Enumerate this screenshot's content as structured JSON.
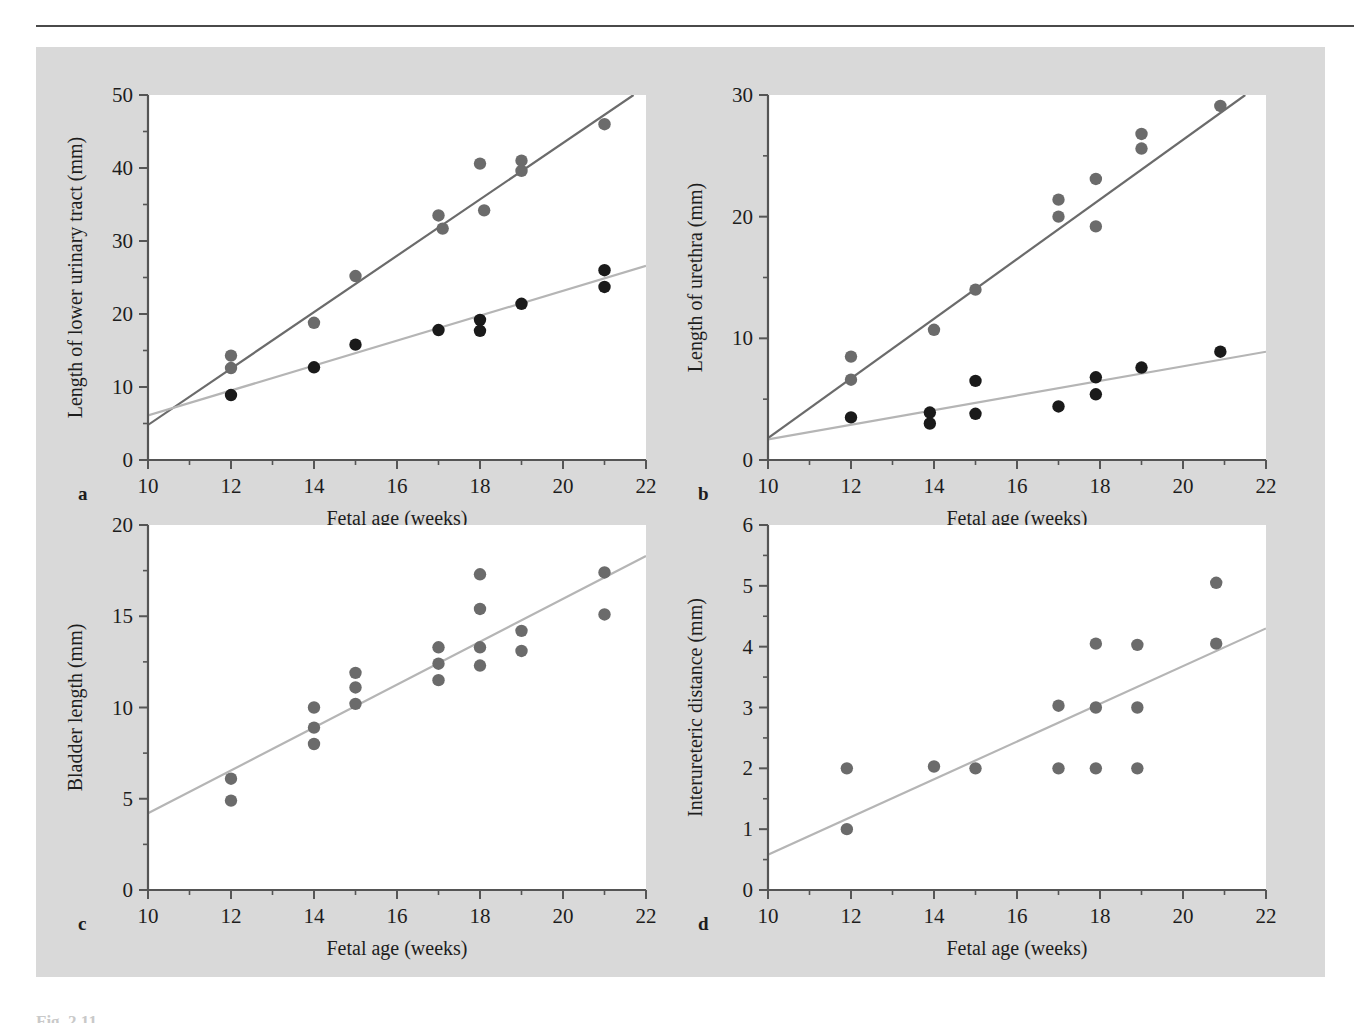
{
  "figure": {
    "background_color": "#d9d9d9",
    "plot_color": "#ffffff",
    "axis_color": "#555555",
    "dark_series_color": "#6b6b6b",
    "black_series_color": "#1a1a1a",
    "light_line_color": "#b5b5b5",
    "caption_partial": "Fig. 2.11",
    "shared_xlabel": "Fetal age (weeks)"
  },
  "panels": [
    {
      "letter": "a",
      "xlabel": "Fetal age (weeks)",
      "ylabel": "Length of lower urinary tract (mm)"
    },
    {
      "letter": "b",
      "xlabel": "Fetal age (weeks)",
      "ylabel": "Length of urethra (mm)"
    },
    {
      "letter": "c",
      "xlabel": "Fetal age (weeks)",
      "ylabel": "Bladder length (mm)"
    },
    {
      "letter": "d",
      "xlabel": "Fetal age (weeks)",
      "ylabel": "Interureteric distance (mm)"
    }
  ],
  "chart_data": [
    {
      "type": "scatter",
      "panel": "a",
      "title": "",
      "xlabel": "Fetal age (weeks)",
      "ylabel": "Length of lower urinary tract (mm)",
      "xlim": [
        10,
        22
      ],
      "ylim": [
        0,
        50
      ],
      "xticks": [
        10,
        12,
        14,
        16,
        18,
        20,
        22
      ],
      "xtick_labels": [
        "10",
        "12",
        "14",
        "16",
        "18",
        "20",
        "22"
      ],
      "xminorticks": [
        11,
        13,
        15,
        17,
        19,
        21
      ],
      "yticks": [
        0,
        10,
        20,
        30,
        40,
        50
      ],
      "ytick_labels": [
        "0",
        "10",
        "20",
        "30",
        "40",
        "50"
      ],
      "yminorticks": [
        5,
        15,
        25,
        35,
        45
      ],
      "grid": false,
      "legend": "none",
      "series": [
        {
          "name": "total lower urinary tract",
          "color": "#6b6b6b",
          "marker": "circle",
          "points": [
            [
              12.0,
              14.3
            ],
            [
              12.0,
              12.6
            ],
            [
              14.0,
              18.8
            ],
            [
              15.0,
              25.2
            ],
            [
              17.0,
              33.5
            ],
            [
              17.1,
              31.7
            ],
            [
              18.0,
              40.6
            ],
            [
              18.1,
              34.2
            ],
            [
              19.0,
              41.0
            ],
            [
              19.0,
              39.6
            ],
            [
              21.0,
              46.0
            ]
          ],
          "fit_line": {
            "x": [
              10,
              21.7
            ],
            "y": [
              4.8,
              50.0
            ]
          }
        },
        {
          "name": "urethra subset",
          "color": "#1a1a1a",
          "marker": "circle",
          "points": [
            [
              12.0,
              8.9
            ],
            [
              14.0,
              12.7
            ],
            [
              15.0,
              15.8
            ],
            [
              17.0,
              17.8
            ],
            [
              18.0,
              19.2
            ],
            [
              18.0,
              17.7
            ],
            [
              19.0,
              21.4
            ],
            [
              21.0,
              26.0
            ],
            [
              21.0,
              23.7
            ]
          ],
          "fit_line": {
            "x": [
              10,
              22
            ],
            "y": [
              6.1,
              26.6
            ]
          }
        }
      ]
    },
    {
      "type": "scatter",
      "panel": "b",
      "title": "",
      "xlabel": "Fetal age (weeks)",
      "ylabel": "Length of urethra (mm)",
      "xlim": [
        10,
        22
      ],
      "ylim": [
        0,
        30
      ],
      "xticks": [
        10,
        12,
        14,
        16,
        18,
        20,
        22
      ],
      "xtick_labels": [
        "10",
        "12",
        "14",
        "16",
        "18",
        "20",
        "22"
      ],
      "xminorticks": [
        11,
        13,
        15,
        17,
        19,
        21
      ],
      "yticks": [
        0,
        10,
        20,
        30
      ],
      "ytick_labels": [
        "0",
        "10",
        "20",
        "30"
      ],
      "yminorticks": [
        5,
        15,
        25
      ],
      "grid": false,
      "legend": "none",
      "series": [
        {
          "name": "grey series",
          "color": "#6b6b6b",
          "marker": "circle",
          "points": [
            [
              12.0,
              8.5
            ],
            [
              12.0,
              6.6
            ],
            [
              14.0,
              10.7
            ],
            [
              15.0,
              14.0
            ],
            [
              17.0,
              21.4
            ],
            [
              17.0,
              20.0
            ],
            [
              17.9,
              23.1
            ],
            [
              17.9,
              19.2
            ],
            [
              19.0,
              26.8
            ],
            [
              19.0,
              25.6
            ],
            [
              20.9,
              29.1
            ]
          ],
          "fit_line": {
            "x": [
              10,
              21.5
            ],
            "y": [
              1.8,
              30.0
            ]
          }
        },
        {
          "name": "black series",
          "color": "#1a1a1a",
          "marker": "circle",
          "points": [
            [
              12.0,
              3.5
            ],
            [
              13.9,
              3.9
            ],
            [
              13.9,
              3.0
            ],
            [
              15.0,
              6.5
            ],
            [
              15.0,
              3.8
            ],
            [
              17.0,
              4.4
            ],
            [
              17.9,
              6.8
            ],
            [
              17.9,
              5.4
            ],
            [
              19.0,
              7.6
            ],
            [
              20.9,
              8.9
            ]
          ],
          "fit_line": {
            "x": [
              10,
              22
            ],
            "y": [
              1.7,
              8.9
            ]
          }
        }
      ]
    },
    {
      "type": "scatter",
      "panel": "c",
      "title": "",
      "xlabel": "Fetal age (weeks)",
      "ylabel": "Bladder length (mm)",
      "xlim": [
        10,
        22
      ],
      "ylim": [
        0,
        20
      ],
      "xticks": [
        10,
        12,
        14,
        16,
        18,
        20,
        22
      ],
      "xtick_labels": [
        "10",
        "12",
        "14",
        "16",
        "18",
        "20",
        "22"
      ],
      "xminorticks": [
        11,
        13,
        15,
        17,
        19,
        21
      ],
      "yticks": [
        0,
        5,
        10,
        15,
        20
      ],
      "ytick_labels": [
        "0",
        "5",
        "10",
        "15",
        "20"
      ],
      "yminorticks": [
        2.5,
        7.5,
        12.5,
        17.5
      ],
      "grid": false,
      "legend": "none",
      "series": [
        {
          "name": "bladder length",
          "color": "#6b6b6b",
          "marker": "circle",
          "points": [
            [
              12.0,
              6.1
            ],
            [
              12.0,
              4.9
            ],
            [
              14.0,
              10.0
            ],
            [
              14.0,
              8.9
            ],
            [
              14.0,
              8.0
            ],
            [
              15.0,
              11.9
            ],
            [
              15.0,
              11.1
            ],
            [
              15.0,
              10.2
            ],
            [
              17.0,
              13.3
            ],
            [
              17.0,
              12.4
            ],
            [
              17.0,
              11.5
            ],
            [
              18.0,
              17.3
            ],
            [
              18.0,
              15.4
            ],
            [
              18.0,
              13.3
            ],
            [
              18.0,
              12.3
            ],
            [
              19.0,
              14.2
            ],
            [
              19.0,
              13.1
            ],
            [
              21.0,
              17.4
            ],
            [
              21.0,
              15.1
            ]
          ],
          "fit_line": {
            "x": [
              10,
              22
            ],
            "y": [
              4.2,
              18.3
            ]
          }
        }
      ]
    },
    {
      "type": "scatter",
      "panel": "d",
      "title": "",
      "xlabel": "Fetal age (weeks)",
      "ylabel": "Interureteric distance (mm)",
      "xlim": [
        10,
        22
      ],
      "ylim": [
        0,
        6
      ],
      "xticks": [
        10,
        12,
        14,
        16,
        18,
        20,
        22
      ],
      "xtick_labels": [
        "10",
        "12",
        "14",
        "16",
        "18",
        "20",
        "22"
      ],
      "xminorticks": [
        11,
        13,
        15,
        17,
        19,
        21
      ],
      "yticks": [
        0,
        1,
        2,
        3,
        4,
        5,
        6
      ],
      "ytick_labels": [
        "0",
        "1",
        "2",
        "3",
        "4",
        "5",
        "6"
      ],
      "yminorticks": [
        0.5,
        1.5,
        2.5,
        3.5,
        4.5,
        5.5
      ],
      "grid": false,
      "legend": "none",
      "series": [
        {
          "name": "interureteric distance",
          "color": "#6b6b6b",
          "marker": "circle",
          "points": [
            [
              11.9,
              2.0
            ],
            [
              11.9,
              1.0
            ],
            [
              14.0,
              2.03
            ],
            [
              15.0,
              2.0
            ],
            [
              17.0,
              3.03
            ],
            [
              17.0,
              2.0
            ],
            [
              17.9,
              4.05
            ],
            [
              17.9,
              3.0
            ],
            [
              17.9,
              2.0
            ],
            [
              18.9,
              4.03
            ],
            [
              18.9,
              3.0
            ],
            [
              18.9,
              2.0
            ],
            [
              20.8,
              5.05
            ],
            [
              20.8,
              4.05
            ]
          ],
          "fit_line": {
            "x": [
              10,
              22
            ],
            "y": [
              0.58,
              4.3
            ]
          }
        }
      ]
    }
  ]
}
